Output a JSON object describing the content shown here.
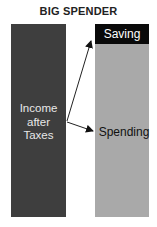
{
  "diagram": {
    "title": "BIG SPENDER",
    "source": {
      "label_lines": [
        "Income",
        "after",
        "Taxes"
      ],
      "color": "#3e3e3e"
    },
    "outcomes": [
      {
        "label": "Saving",
        "color": "#0a0a0a",
        "text_color": "#ffffff",
        "share": "small (top)"
      },
      {
        "label": "Spending",
        "color": "#a9a9a9",
        "text_color": "#111111",
        "share": "large (rest)"
      }
    ],
    "arrows": [
      {
        "from": "Income after Taxes",
        "to": "Saving"
      },
      {
        "from": "Income after Taxes",
        "to": "Spending"
      }
    ]
  }
}
